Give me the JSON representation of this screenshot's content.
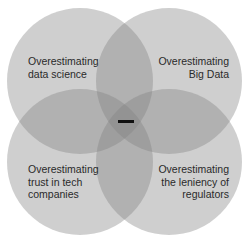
{
  "diagram": {
    "type": "venn",
    "circles": [
      {
        "id": "top-left",
        "label": "Overestimating\ndata science"
      },
      {
        "id": "top-right",
        "label": "Overestimating\nBig Data"
      },
      {
        "id": "bottom-left",
        "label": "Overestimating\ntrust in tech\ncompanies"
      },
      {
        "id": "bottom-right",
        "label": "Overestimating\nthe leniency of\nregulators"
      }
    ],
    "center_mark": "—",
    "fill_color": "#808080",
    "text_color": "#2a2a2a"
  }
}
